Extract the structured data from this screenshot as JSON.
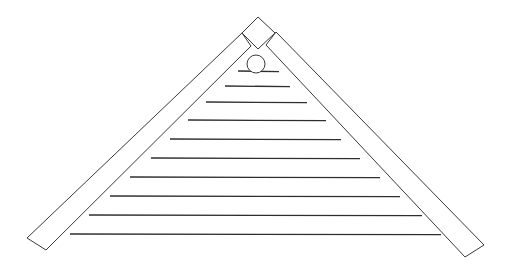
{
  "diagram": {
    "title": "",
    "canvas": {
      "width": 512,
      "height": 274,
      "background": "#ffffff"
    },
    "colors": {
      "stroke": "#3a3a3a",
      "slat": "#2e2e2e",
      "fill": "#ffffff"
    },
    "left_beam": {
      "points": [
        [
          27,
          238
        ],
        [
          46,
          250
        ],
        [
          251,
          46
        ],
        [
          242,
          33
        ]
      ]
    },
    "right_beam": {
      "points": [
        [
          276,
          32
        ],
        [
          266,
          45
        ],
        [
          465,
          257
        ],
        [
          484,
          245
        ]
      ]
    },
    "peak_block": {
      "points": [
        [
          258,
          17
        ],
        [
          275,
          33
        ],
        [
          258,
          49
        ],
        [
          242,
          33
        ]
      ]
    },
    "pin": {
      "cx": 256,
      "cy": 64,
      "r": 9
    },
    "slats": [
      {
        "y": 71,
        "x1": 238,
        "x2": 279
      },
      {
        "y": 86,
        "x1": 225,
        "x2": 290
      },
      {
        "y": 102,
        "x1": 206,
        "x2": 307
      },
      {
        "y": 120,
        "x1": 188,
        "x2": 326
      },
      {
        "y": 139,
        "x1": 170,
        "x2": 341
      },
      {
        "y": 158,
        "x1": 151,
        "x2": 360
      },
      {
        "y": 177,
        "x1": 130,
        "x2": 380
      },
      {
        "y": 196,
        "x1": 110,
        "x2": 400
      },
      {
        "y": 215,
        "x1": 89,
        "x2": 422
      },
      {
        "y": 234,
        "x1": 70,
        "x2": 441
      }
    ]
  }
}
